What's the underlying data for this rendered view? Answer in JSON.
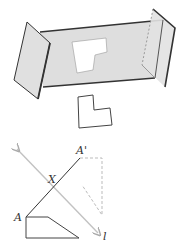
{
  "figure": {
    "top": {
      "description": "3D view: a translucent gray mirror plane between two side panels, with a white L-shaped figure reflected on it and the original L shape below",
      "colors": {
        "panel_fill": "#dcdcdc",
        "edge": "#333333",
        "shape_fill": "#ffffff",
        "dashed": "#999999"
      }
    },
    "bottom": {
      "labels": {
        "point_a": "A",
        "point_a_prime": "A'",
        "intersection": "X",
        "line": "l"
      },
      "colors": {
        "line_l": "#bbbbbb",
        "segment": "#333333",
        "dashed": "#bbbbbb"
      }
    }
  }
}
